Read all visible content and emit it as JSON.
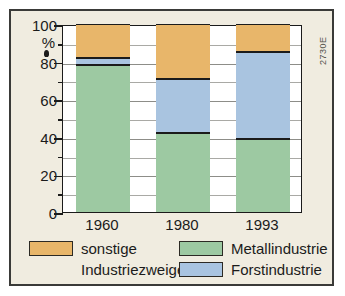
{
  "figure": {
    "corner_code": "2730E",
    "background_color": "#f0ece0",
    "frame_color": "#3a3a38"
  },
  "chart_data": {
    "type": "bar",
    "stacked": true,
    "title": "",
    "subtitle": "",
    "xlabel": "",
    "ylabel": "%",
    "categories": [
      "1960",
      "1980",
      "1993"
    ],
    "ylim": [
      0,
      100
    ],
    "yticks": [
      0,
      20,
      40,
      60,
      80,
      100
    ],
    "ytick_labels": [
      "0",
      "20",
      "40",
      "60",
      "80",
      "100"
    ],
    "yminor_ticks": [
      10,
      30,
      50,
      70,
      90
    ],
    "grid": true,
    "grid_interval": 10,
    "legend_position": "bottom",
    "series": [
      {
        "name": "Metallindustrie",
        "color": "#9dc9a2",
        "values": [
          78,
          42,
          39
        ]
      },
      {
        "name": "Forstindustrie",
        "color": "#a9c4e0",
        "values": [
          4,
          29,
          46
        ]
      },
      {
        "name": "sonstige Industriezweige",
        "color": "#e8b66a",
        "values": [
          18,
          29,
          15
        ]
      }
    ],
    "stack_boundaries": {
      "1960": {
        "Metallindustrie": [
          0,
          78
        ],
        "Forstindustrie": [
          78,
          82
        ],
        "sonstige Industriezweige": [
          82,
          100
        ]
      },
      "1980": {
        "Metallindustrie": [
          0,
          42
        ],
        "Forstindustrie": [
          42,
          71
        ],
        "sonstige Industriezweige": [
          71,
          100
        ]
      },
      "1993": {
        "Metallindustrie": [
          0,
          39
        ],
        "Forstindustrie": [
          39,
          85
        ],
        "sonstige Industriezweige": [
          85,
          100
        ]
      }
    }
  },
  "axis": {
    "unit_label": "%"
  },
  "legend": {
    "items": [
      {
        "label_line1": "sonstige",
        "label_line2": "Industriezweige",
        "color": "#e8b66a",
        "name": "sonstige-industriezweige"
      },
      {
        "label_line1": "Metallindustrie",
        "label_line2": "",
        "color": "#9dc9a2",
        "name": "metallindustrie"
      },
      {
        "label_line1": "Forstindustrie",
        "label_line2": "",
        "color": "#a9c4e0",
        "name": "forstindustrie"
      }
    ]
  }
}
